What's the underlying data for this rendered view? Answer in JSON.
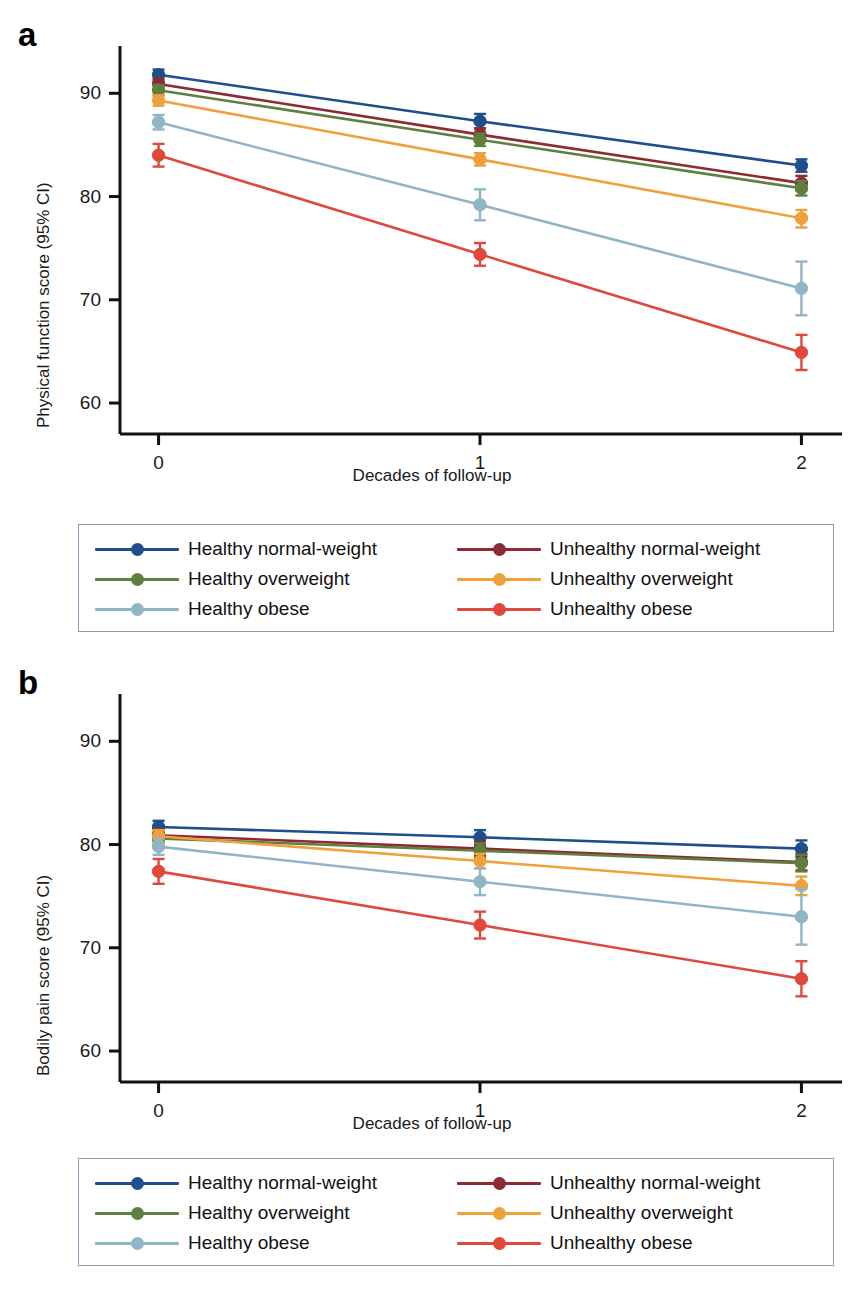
{
  "figure": {
    "panels": [
      {
        "letter": "a",
        "ylabel": "Physical function score (95% CI)",
        "xlabel": "Decades of follow-up"
      },
      {
        "letter": "b",
        "ylabel": "Bodily pain score (95% CI)",
        "xlabel": "Decades of follow-up"
      }
    ]
  },
  "legend": {
    "items": [
      {
        "label": "Healthy normal-weight",
        "color": "#1f4e8c"
      },
      {
        "label": "Unhealthy normal-weight",
        "color": "#8c2b33"
      },
      {
        "label": "Healthy overweight",
        "color": "#5f7f3f"
      },
      {
        "label": "Unhealthy overweight",
        "color": "#efa13c"
      },
      {
        "label": "Healthy obese",
        "color": "#8fb5c6"
      },
      {
        "label": "Unhealthy obese",
        "color": "#e0483c"
      }
    ]
  },
  "chart_data": [
    {
      "type": "line",
      "title": "a",
      "xlabel": "Decades of follow-up",
      "ylabel": "Physical function score (95% CI)",
      "x": [
        0,
        1,
        2
      ],
      "xticks": [
        "0",
        "1",
        "2"
      ],
      "yticks": [
        60,
        70,
        80,
        90
      ],
      "ylim": [
        57,
        94
      ],
      "xlim": [
        -0.12,
        2.12
      ],
      "grid": false,
      "legend_position": "below",
      "series": [
        {
          "name": "Healthy normal-weight",
          "color": "#1f4e8c",
          "values": [
            91.8,
            87.3,
            83.0
          ],
          "ci_low": [
            91.2,
            86.6,
            82.4
          ],
          "ci_high": [
            92.3,
            88.0,
            83.6
          ]
        },
        {
          "name": "Unhealthy normal-weight",
          "color": "#8c2b33",
          "values": [
            90.9,
            86.0,
            81.3
          ],
          "ci_low": [
            90.4,
            85.4,
            80.6
          ],
          "ci_high": [
            91.4,
            86.6,
            82.0
          ]
        },
        {
          "name": "Healthy overweight",
          "color": "#5f7f3f",
          "values": [
            90.3,
            85.5,
            80.8
          ],
          "ci_low": [
            89.8,
            84.9,
            80.1
          ],
          "ci_high": [
            90.8,
            86.1,
            81.5
          ]
        },
        {
          "name": "Unhealthy overweight",
          "color": "#efa13c",
          "values": [
            89.3,
            83.6,
            77.9
          ],
          "ci_low": [
            88.8,
            83.0,
            77.0
          ],
          "ci_high": [
            89.8,
            84.2,
            78.7
          ]
        },
        {
          "name": "Healthy obese",
          "color": "#8fb5c6",
          "values": [
            87.2,
            79.2,
            71.1
          ],
          "ci_low": [
            86.5,
            77.7,
            68.5
          ],
          "ci_high": [
            87.9,
            80.7,
            73.7
          ]
        },
        {
          "name": "Unhealthy obese",
          "color": "#e0483c",
          "values": [
            84.0,
            74.4,
            64.9
          ],
          "ci_low": [
            82.9,
            73.3,
            63.2
          ],
          "ci_high": [
            85.1,
            75.5,
            66.6
          ]
        }
      ]
    },
    {
      "type": "line",
      "title": "b",
      "xlabel": "Decades of follow-up",
      "ylabel": "Bodily pain score (95% CI)",
      "x": [
        0,
        1,
        2
      ],
      "xticks": [
        "0",
        "1",
        "2"
      ],
      "yticks": [
        60,
        70,
        80,
        90
      ],
      "ylim": [
        57,
        94
      ],
      "xlim": [
        -0.12,
        2.12
      ],
      "grid": false,
      "legend_position": "below",
      "series": [
        {
          "name": "Healthy normal-weight",
          "color": "#1f4e8c",
          "values": [
            81.7,
            80.7,
            79.6
          ],
          "ci_low": [
            81.1,
            80.0,
            78.8
          ],
          "ci_high": [
            82.3,
            81.4,
            80.4
          ]
        },
        {
          "name": "Unhealthy normal-weight",
          "color": "#8c2b33",
          "values": [
            80.9,
            79.6,
            78.3
          ],
          "ci_low": [
            80.3,
            78.9,
            77.5
          ],
          "ci_high": [
            81.5,
            80.3,
            79.1
          ]
        },
        {
          "name": "Healthy overweight",
          "color": "#5f7f3f",
          "values": [
            80.6,
            79.4,
            78.2
          ],
          "ci_low": [
            80.0,
            78.7,
            77.4
          ],
          "ci_high": [
            81.2,
            80.1,
            79.0
          ]
        },
        {
          "name": "Unhealthy overweight",
          "color": "#efa13c",
          "values": [
            80.8,
            78.4,
            76.0
          ],
          "ci_low": [
            80.2,
            77.7,
            75.1
          ],
          "ci_high": [
            81.4,
            79.1,
            76.9
          ]
        },
        {
          "name": "Healthy obese",
          "color": "#8fb5c6",
          "values": [
            79.8,
            76.4,
            73.0
          ],
          "ci_low": [
            79.0,
            75.1,
            70.3
          ],
          "ci_high": [
            80.6,
            77.7,
            75.7
          ]
        },
        {
          "name": "Unhealthy obese",
          "color": "#e0483c",
          "values": [
            77.4,
            72.2,
            67.0
          ],
          "ci_low": [
            76.2,
            70.9,
            65.3
          ],
          "ci_high": [
            78.6,
            73.5,
            68.7
          ]
        }
      ]
    }
  ]
}
